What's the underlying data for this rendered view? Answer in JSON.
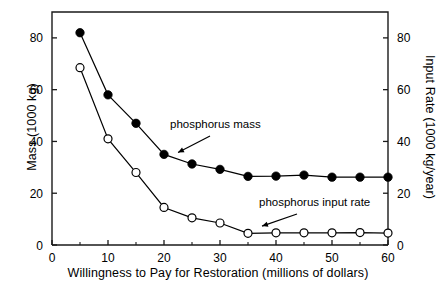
{
  "chart_data": {
    "type": "line",
    "title": "",
    "xlabel": "Willingness to Pay for Restoration (millions of dollars)",
    "ylabel": "Mass (1000 kg)",
    "y2label": "Input Rate (1000 kg/year)",
    "x": [
      5,
      10,
      15,
      20,
      25,
      30,
      35,
      40,
      45,
      50,
      55,
      60
    ],
    "xlim": [
      0,
      60
    ],
    "ylim": [
      0,
      90
    ],
    "y2lim": [
      0,
      90
    ],
    "xticks": [
      0,
      10,
      20,
      30,
      40,
      50,
      60
    ],
    "xticklabels": [
      "0",
      "10",
      "20",
      "30",
      "40",
      "50",
      "60"
    ],
    "xminorticks": [
      5,
      15,
      25,
      35,
      45,
      55
    ],
    "yticks": [
      0,
      20,
      40,
      60,
      80
    ],
    "yticklabels": [
      "0",
      "20",
      "40",
      "60",
      "80"
    ],
    "y2ticks": [
      0,
      20,
      40,
      60,
      80
    ],
    "y2ticklabels": [
      "0",
      "20",
      "40",
      "60",
      "80"
    ],
    "grid": false,
    "legend_position": "inline-annotations",
    "series": [
      {
        "name": "phosphorus mass",
        "marker": "filled-circle",
        "axis": "left",
        "color": "#000000",
        "values": [
          82,
          58,
          47,
          35,
          31.3,
          29.2,
          26.5,
          26.6,
          27,
          26.2,
          26.2,
          26.2
        ]
      },
      {
        "name": "phosphorus input rate",
        "marker": "open-circle",
        "axis": "right",
        "color": "#000000",
        "values": [
          68.5,
          41,
          28,
          14.5,
          10.5,
          8.5,
          4.5,
          4.7,
          4.7,
          4.7,
          4.8,
          4.6
        ]
      }
    ],
    "annotations": [
      {
        "text": "phosphorus mass",
        "target_x": 22.5,
        "target_y": 33
      },
      {
        "text": "phosphorus input rate",
        "target_x": 37.5,
        "target_y": 4.6
      }
    ]
  },
  "axes": {
    "x_title": "Willingness to Pay for Restoration (millions of dollars)",
    "y_left_title": "Mass (1000 kg)",
    "y_right_title": "Input Rate (1000 kg/year)"
  },
  "annotations": {
    "mass_label": "phosphorus mass",
    "rate_label": "phosphorus input rate"
  },
  "ticks": {
    "x": [
      "0",
      "10",
      "20",
      "30",
      "40",
      "50",
      "60"
    ],
    "y_left": [
      "0",
      "20",
      "40",
      "60",
      "80"
    ],
    "y_right": [
      "0",
      "20",
      "40",
      "60",
      "80"
    ]
  },
  "colors": {
    "axis": "#1a1a1a",
    "series_filled": "#000000",
    "series_open_stroke": "#000000",
    "series_open_fill": "#ffffff",
    "background": "#ffffff"
  }
}
